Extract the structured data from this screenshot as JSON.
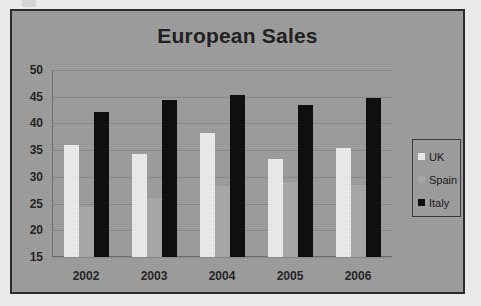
{
  "chart_data": {
    "type": "bar",
    "title": "European Sales",
    "xlabel": "",
    "ylabel": "",
    "categories": [
      "2002",
      "2003",
      "2004",
      "2005",
      "2006"
    ],
    "series": [
      {
        "name": "UK",
        "color": "#ececec",
        "values": [
          36.0,
          34.3,
          38.3,
          33.3,
          35.4
        ]
      },
      {
        "name": "Spain",
        "color": "#a8a8a8",
        "values": [
          24.4,
          26.0,
          28.3,
          29.0,
          28.5
        ]
      },
      {
        "name": "Italy",
        "color": "#0a0a0a",
        "values": [
          42.2,
          44.4,
          45.3,
          43.4,
          44.7
        ]
      }
    ],
    "ylim": [
      15,
      50
    ],
    "yticks": [
      "50",
      "45",
      "40",
      "35",
      "30",
      "25",
      "20",
      "15"
    ],
    "ytick_values": [
      50,
      45,
      40,
      35,
      30,
      25,
      20,
      15
    ],
    "grid": true,
    "legend_position": "right",
    "legend_entries": [
      "UK",
      "Spain",
      "Italy"
    ]
  },
  "style": {
    "plot_background": "#9d9d9d",
    "frame_border": "#2b2b2b",
    "gridline_color": "#8a8a8a",
    "text_color": "#1c1c1c"
  }
}
